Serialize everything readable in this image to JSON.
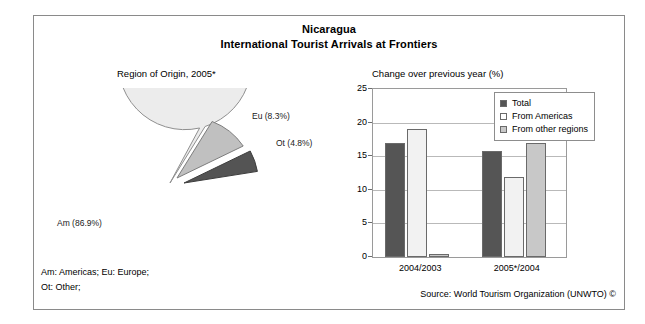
{
  "titles": {
    "country": "Nicaragua",
    "subject": "International Tourist Arrivals at Frontiers"
  },
  "panels": {
    "pie_caption": "Region of Origin, 2005*",
    "bar_caption": "Change over previous year (%)"
  },
  "footer": {
    "note_line_1": "Am: Americas; Eu: Europe;",
    "note_line_2": "Ot: Other;",
    "source": "Source: World Tourism Organization (UNWTO) ©"
  },
  "legend": {
    "items": [
      {
        "label": "Total",
        "key": "total",
        "color": "#555555"
      },
      {
        "label": "From Americas",
        "key": "americas",
        "color": "#ffffff"
      },
      {
        "label": "From other regions",
        "key": "other-regions",
        "color": "#c8c8c8"
      }
    ]
  },
  "pie_labels": {
    "eu": "Eu (8.3%)",
    "ot": "Ot (4.8%)",
    "am": "Am (86.9%)"
  },
  "chart_data": [
    {
      "type": "pie",
      "title": "Region of Origin, 2005*",
      "categories": [
        "Am",
        "Eu",
        "Ot"
      ],
      "labels": [
        "Am (86.9%)",
        "Eu (8.3%)",
        "Ot (4.8%)"
      ],
      "values": [
        86.9,
        8.3,
        4.8
      ],
      "units": "percent",
      "colors": [
        "#ececec",
        "#c0c0c0",
        "#545454"
      ],
      "exploded": [
        "Eu",
        "Ot"
      ],
      "legend": "none",
      "notes": "Am: Americas; Eu: Europe; Ot: Other;"
    },
    {
      "type": "bar",
      "title": "Change over previous year (%)",
      "xlabel": "",
      "ylabel": "",
      "categories": [
        "2004/2003",
        "2005*/2004"
      ],
      "series": [
        {
          "name": "Total",
          "values": [
            16.9,
            15.8
          ],
          "color": "#555555"
        },
        {
          "name": "From Americas",
          "values": [
            19.1,
            11.9
          ],
          "color": "#f2f2f2"
        },
        {
          "name": "From other regions",
          "values": [
            0.5,
            16.9
          ],
          "color": "#c8c8c8"
        }
      ],
      "ylim": [
        0,
        25
      ],
      "yticks": [
        0,
        5,
        10,
        15,
        20,
        25
      ],
      "ytick_labels": [
        "0",
        "5",
        "10",
        "15",
        "20",
        "25"
      ],
      "grid": true,
      "legend_position": "top-right"
    }
  ]
}
